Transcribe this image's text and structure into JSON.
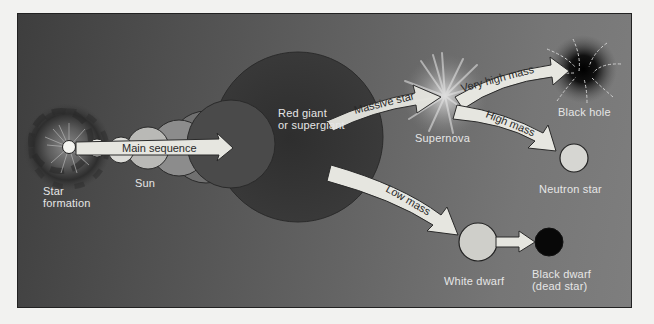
{
  "diagram": {
    "colors": {
      "background_dark": "#3e3e3e",
      "background_light": "#7e7e7e",
      "arrow_fill": "#e8e8e2",
      "label_text": "#e6e6e6",
      "arrow_text": "#2a2a2a",
      "black_dwarf": "#080808"
    },
    "nodes": {
      "star_formation": {
        "line1": "Star",
        "line2": "formation"
      },
      "sun": {
        "label": "Sun"
      },
      "red_giant": {
        "line1": "Red giant",
        "line2": "or supergiant"
      },
      "supernova": {
        "label": "Supernova"
      },
      "black_hole": {
        "label": "Black hole"
      },
      "neutron_star": {
        "label": "Neutron star"
      },
      "white_dwarf": {
        "label": "White dwarf"
      },
      "black_dwarf": {
        "line1": "Black dwarf",
        "line2": "(dead star)"
      }
    },
    "arrows": {
      "main_sequence": "Main sequence",
      "massive_star": "Massive star",
      "very_high_mass": "Very high mass",
      "high_mass": "High mass",
      "low_mass": "Low mass"
    }
  }
}
